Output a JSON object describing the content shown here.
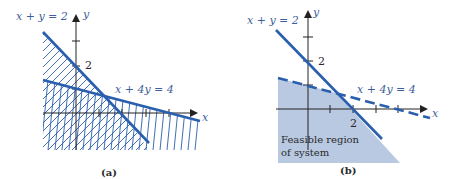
{
  "figure": {
    "panels": [
      {
        "id": "a",
        "caption": "(a)",
        "axis_labels": {
          "x": "x",
          "y": "y"
        },
        "tick_label_y": "2",
        "lines": [
          {
            "equation": "x + y = 2",
            "style": "solid",
            "shading": "below"
          },
          {
            "equation": "x + 4y = 4",
            "style": "solid",
            "shading": "below"
          }
        ]
      },
      {
        "id": "b",
        "caption": "(b)",
        "axis_labels": {
          "x": "x",
          "y": "y"
        },
        "tick_label_y": "2",
        "tick_label_x": "2",
        "lines": [
          {
            "equation": "x + y = 2",
            "style": "solid"
          },
          {
            "equation": "x + 4y = 4",
            "style": "dashed"
          }
        ],
        "region_label_line1": "Feasible region",
        "region_label_line2": "of system",
        "region_fill": "#b9c9e2"
      }
    ],
    "colors": {
      "line": "#2a5fae",
      "label": "#3e5f9a",
      "axis": "#222222"
    }
  }
}
